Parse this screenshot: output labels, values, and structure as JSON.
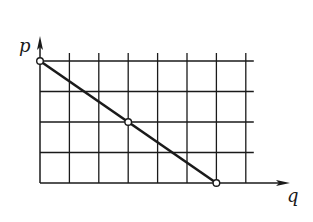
{
  "chart_data": {
    "type": "line",
    "title": "",
    "xlabel": "q",
    "ylabel": "p",
    "x": [
      0,
      3,
      6
    ],
    "y": [
      4,
      2,
      0
    ],
    "series": [
      {
        "name": "p vs q",
        "points": [
          [
            0,
            4
          ],
          [
            3,
            2
          ],
          [
            6,
            0
          ]
        ],
        "markers": "open-circle"
      }
    ],
    "xlim": [
      0,
      7
    ],
    "ylim": [
      0,
      4
    ],
    "grid": true,
    "grid_columns": 7,
    "grid_rows": 4,
    "tick_labels": false,
    "legend": null,
    "colors": {
      "line": "#1a1a1a",
      "grid": "#1a1a1a",
      "background": "#ffffff",
      "marker_fill": "#ffffff"
    }
  },
  "labels": {
    "y_axis": "p",
    "x_axis": "q"
  }
}
